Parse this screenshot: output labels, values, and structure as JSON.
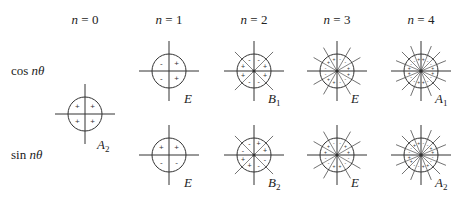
{
  "columns": [
    {
      "n_var": "n",
      "eq": " = 0",
      "x": 85
    },
    {
      "n_var": "n",
      "eq": " = 1",
      "x": 169
    },
    {
      "n_var": "n",
      "eq": " = 2",
      "x": 254
    },
    {
      "n_var": "n",
      "eq": " = 3",
      "x": 337
    },
    {
      "n_var": "n",
      "eq": " = 4",
      "x": 421
    }
  ],
  "rows": [
    {
      "func": "cos ",
      "var": "nθ",
      "y": 71
    },
    {
      "func": "sin ",
      "var": "nθ",
      "y": 155
    }
  ],
  "symmetry_labels": {
    "n0": {
      "main": "A",
      "sub": "2"
    },
    "cos_n1": {
      "main": "E",
      "sub": ""
    },
    "cos_n2": {
      "main": "B",
      "sub": "1"
    },
    "cos_n3": {
      "main": "E",
      "sub": ""
    },
    "cos_n4": {
      "main": "A",
      "sub": "1"
    },
    "sin_n1": {
      "main": "E",
      "sub": ""
    },
    "sin_n2": {
      "main": "B",
      "sub": "2"
    },
    "sin_n3": {
      "main": "E",
      "sub": ""
    },
    "sin_n4": {
      "main": "A",
      "sub": "2"
    }
  },
  "diagrams": [
    {
      "id": "n0",
      "cx": 85,
      "cy": 114,
      "n": 0,
      "func": "const",
      "signs": [
        "+",
        "+",
        "+",
        "+"
      ]
    },
    {
      "id": "cos_n1",
      "cx": 169,
      "cy": 71,
      "n": 1,
      "func": "cos",
      "signs_quadrants": {
        "upper_left": "-",
        "upper_right": "+",
        "lower_left": "-",
        "lower_right": "+"
      }
    },
    {
      "id": "sin_n1",
      "cx": 169,
      "cy": 155,
      "n": 1,
      "func": "sin",
      "signs_quadrants": {
        "upper_left": "+",
        "upper_right": "+",
        "lower_left": "-",
        "lower_right": "-"
      }
    },
    {
      "id": "cos_n2",
      "cx": 254,
      "cy": 71,
      "n": 2,
      "func": "cos"
    },
    {
      "id": "sin_n2",
      "cx": 254,
      "cy": 155,
      "n": 2,
      "func": "sin"
    },
    {
      "id": "cos_n3",
      "cx": 337,
      "cy": 71,
      "n": 3,
      "func": "cos"
    },
    {
      "id": "sin_n3",
      "cx": 337,
      "cy": 155,
      "n": 3,
      "func": "sin"
    },
    {
      "id": "cos_n4",
      "cx": 421,
      "cy": 71,
      "n": 4,
      "func": "cos"
    },
    {
      "id": "sin_n4",
      "cx": 421,
      "cy": 155,
      "n": 4,
      "func": "sin"
    }
  ],
  "style": {
    "stroke": "#333333",
    "radius": 17,
    "axis_half": 30,
    "ray_outer": 27
  }
}
